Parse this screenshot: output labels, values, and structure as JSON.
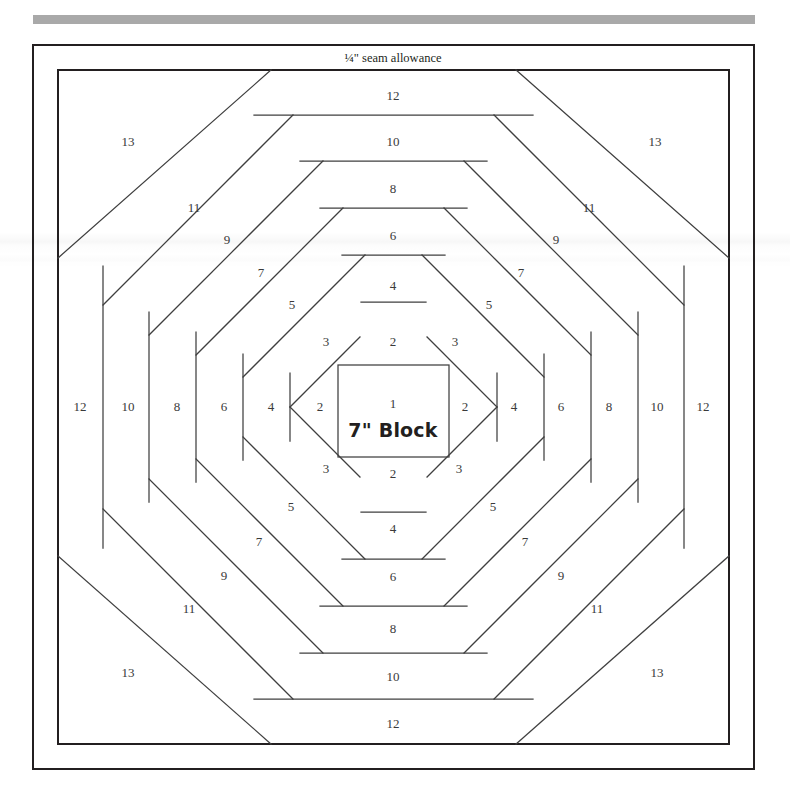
{
  "page": {
    "background_color": "#ffffff",
    "rule_color": "#a9a9a9",
    "line_color": "#231f20",
    "label_color": "#3a3a3a"
  },
  "figure": {
    "seam_allowance_label": "¼\" seam allowance",
    "center_piece_number": "1",
    "center_block_size": "7\" Block"
  },
  "chart_data": {
    "type": "diagram",
    "center": {
      "number": "1",
      "caption": "7\" Block"
    },
    "ring_numbers": [
      2,
      3,
      4,
      5,
      6,
      7,
      8,
      9,
      10,
      11,
      12,
      13
    ],
    "even_rings_position": "straight logs on top, bottom, left and right edges",
    "odd_rings_position": "diagonal logs on the four corners",
    "border_label": "¼\" seam allowance",
    "labels": [
      {
        "text": "¼\" seam allowance",
        "x": 393,
        "y": 58,
        "role": "border-note",
        "style": "seam"
      },
      {
        "text": "12",
        "x": 393,
        "y": 95,
        "role": "top-log"
      },
      {
        "text": "10",
        "x": 393,
        "y": 141,
        "role": "top-log"
      },
      {
        "text": "8",
        "x": 393,
        "y": 188,
        "role": "top-log"
      },
      {
        "text": "6",
        "x": 393,
        "y": 235,
        "role": "top-log"
      },
      {
        "text": "4",
        "x": 393,
        "y": 285,
        "role": "top-log"
      },
      {
        "text": "2",
        "x": 393,
        "y": 341,
        "role": "top-log"
      },
      {
        "text": "12",
        "x": 393,
        "y": 723,
        "role": "bottom-log"
      },
      {
        "text": "10",
        "x": 393,
        "y": 676,
        "role": "bottom-log"
      },
      {
        "text": "8",
        "x": 393,
        "y": 628,
        "role": "bottom-log"
      },
      {
        "text": "6",
        "x": 393,
        "y": 576,
        "role": "bottom-log"
      },
      {
        "text": "4",
        "x": 393,
        "y": 528,
        "role": "bottom-log"
      },
      {
        "text": "2",
        "x": 393,
        "y": 473,
        "role": "bottom-log"
      },
      {
        "text": "12",
        "x": 80,
        "y": 406,
        "role": "left-log"
      },
      {
        "text": "10",
        "x": 128,
        "y": 406,
        "role": "left-log"
      },
      {
        "text": "8",
        "x": 177,
        "y": 406,
        "role": "left-log"
      },
      {
        "text": "6",
        "x": 224,
        "y": 406,
        "role": "left-log"
      },
      {
        "text": "4",
        "x": 271,
        "y": 406,
        "role": "left-log"
      },
      {
        "text": "2",
        "x": 320,
        "y": 406,
        "role": "left-log"
      },
      {
        "text": "12",
        "x": 703,
        "y": 406,
        "role": "right-log"
      },
      {
        "text": "10",
        "x": 657,
        "y": 406,
        "role": "right-log"
      },
      {
        "text": "8",
        "x": 609,
        "y": 406,
        "role": "right-log"
      },
      {
        "text": "6",
        "x": 561,
        "y": 406,
        "role": "right-log"
      },
      {
        "text": "4",
        "x": 514,
        "y": 406,
        "role": "right-log"
      },
      {
        "text": "2",
        "x": 465,
        "y": 406,
        "role": "right-log"
      },
      {
        "text": "13",
        "x": 128,
        "y": 141,
        "role": "corner-log-top-left"
      },
      {
        "text": "11",
        "x": 194,
        "y": 207,
        "role": "corner-log-top-left"
      },
      {
        "text": "9",
        "x": 227,
        "y": 239,
        "role": "corner-log-top-left"
      },
      {
        "text": "7",
        "x": 261,
        "y": 272,
        "role": "corner-log-top-left"
      },
      {
        "text": "5",
        "x": 292,
        "y": 304,
        "role": "corner-log-top-left"
      },
      {
        "text": "3",
        "x": 326,
        "y": 341,
        "role": "corner-log-top-left"
      },
      {
        "text": "13",
        "x": 655,
        "y": 141,
        "role": "corner-log-top-right"
      },
      {
        "text": "11",
        "x": 589,
        "y": 207,
        "role": "corner-log-top-right"
      },
      {
        "text": "9",
        "x": 556,
        "y": 239,
        "role": "corner-log-top-right"
      },
      {
        "text": "7",
        "x": 521,
        "y": 272,
        "role": "corner-log-top-right"
      },
      {
        "text": "5",
        "x": 489,
        "y": 304,
        "role": "corner-log-top-right"
      },
      {
        "text": "3",
        "x": 455,
        "y": 341,
        "role": "corner-log-top-right"
      },
      {
        "text": "13",
        "x": 128,
        "y": 672,
        "role": "corner-log-bottom-left"
      },
      {
        "text": "11",
        "x": 189,
        "y": 608,
        "role": "corner-log-bottom-left"
      },
      {
        "text": "9",
        "x": 224,
        "y": 575,
        "role": "corner-log-bottom-left"
      },
      {
        "text": "7",
        "x": 259,
        "y": 541,
        "role": "corner-log-bottom-left"
      },
      {
        "text": "5",
        "x": 291,
        "y": 506,
        "role": "corner-log-bottom-left"
      },
      {
        "text": "3",
        "x": 326,
        "y": 468,
        "role": "corner-log-bottom-left"
      },
      {
        "text": "13",
        "x": 657,
        "y": 672,
        "role": "corner-log-bottom-right"
      },
      {
        "text": "11",
        "x": 597,
        "y": 608,
        "role": "corner-log-bottom-right"
      },
      {
        "text": "9",
        "x": 561,
        "y": 575,
        "role": "corner-log-bottom-right"
      },
      {
        "text": "7",
        "x": 525,
        "y": 541,
        "role": "corner-log-bottom-right"
      },
      {
        "text": "5",
        "x": 493,
        "y": 506,
        "role": "corner-log-bottom-right"
      },
      {
        "text": "3",
        "x": 459,
        "y": 468,
        "role": "corner-log-bottom-right"
      },
      {
        "text": "1",
        "x": 393,
        "y": 403,
        "role": "center-number",
        "style": "center-num"
      },
      {
        "text": "7\" Block",
        "x": 393,
        "y": 430,
        "role": "center-caption",
        "style": "block-size"
      }
    ]
  }
}
